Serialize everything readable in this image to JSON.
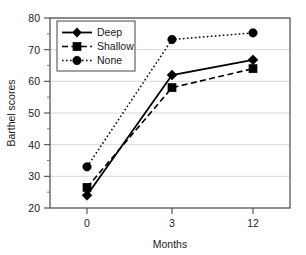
{
  "chart_data": {
    "type": "line",
    "title": "",
    "xlabel": "Months",
    "ylabel": "Barthel scores",
    "x": [
      0,
      3,
      12
    ],
    "xtick_labels": [
      "0",
      "3",
      "12"
    ],
    "ytick_labels": [
      "20",
      "30",
      "40",
      "50",
      "60",
      "70",
      "80"
    ],
    "yticks": [
      20,
      30,
      40,
      50,
      60,
      70,
      80
    ],
    "ylim": [
      20,
      80
    ],
    "grid": "horizontal",
    "legend_position": "upper-left-inside",
    "series": [
      {
        "name": "Deep",
        "values": [
          24,
          62,
          66.8
        ],
        "marker": "diamond",
        "linestyle": "solid",
        "color": "#000000"
      },
      {
        "name": "Shallow",
        "values": [
          26.5,
          58,
          64
        ],
        "marker": "square",
        "linestyle": "dashed",
        "color": "#000000"
      },
      {
        "name": "None",
        "values": [
          33,
          73.2,
          75.3
        ],
        "marker": "circle",
        "linestyle": "dotted",
        "color": "#000000"
      }
    ]
  },
  "axes": {
    "y_axis_title": "Barthel scores",
    "x_axis_title": "Months"
  },
  "legend": {
    "entries": [
      {
        "label": "Deep",
        "marker": "diamond-marker",
        "line": "solid-line"
      },
      {
        "label": "Shallow",
        "marker": "square-marker",
        "line": "dashed-line"
      },
      {
        "label": "None",
        "marker": "circle-marker",
        "line": "dotted-line"
      }
    ]
  },
  "colors": {
    "series": "#000000",
    "grid": "#d4d4d4",
    "frame": "#4a4a4a",
    "text": "#1a1a1a",
    "background": "#ffffff"
  }
}
